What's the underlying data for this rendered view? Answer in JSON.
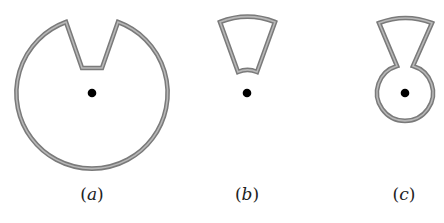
{
  "figure": {
    "panels": [
      {
        "id": "a",
        "label_open": "(",
        "label_letter": "a",
        "label_close": ")",
        "shape": "circle-with-v-notch",
        "pivot": [
          92,
          93
        ]
      },
      {
        "id": "b",
        "label_open": "(",
        "label_letter": "b",
        "label_close": ")",
        "shape": "annular-sector-wedge",
        "pivot": [
          247,
          93
        ]
      },
      {
        "id": "c",
        "label_open": "(",
        "label_letter": "c",
        "label_close": ")",
        "shape": "wedge-joined-to-small-circle",
        "pivot": [
          405,
          93
        ]
      }
    ],
    "colors": {
      "outline": "#7a7a7a",
      "outline_inner": "#b8b8b8",
      "pivot_dot": "#000000",
      "background": "#ffffff"
    }
  }
}
